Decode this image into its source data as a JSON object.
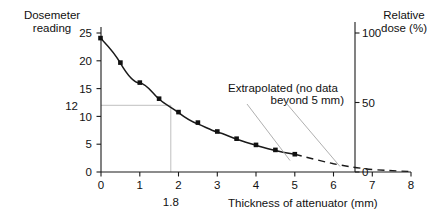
{
  "chart_data": {
    "type": "line",
    "title": "",
    "xlabel": "Thickness of attenuator (mm)",
    "ylabel": "Dosemeter reading",
    "ylabel_right": "Relative dose (%)",
    "xlim": [
      0,
      8
    ],
    "ylim": [
      0,
      25
    ],
    "ylim_right": [
      0,
      100
    ],
    "grid": false,
    "legend": null,
    "xticks": [
      0,
      1,
      2,
      3,
      4,
      5,
      6,
      7,
      8
    ],
    "xticklabels": [
      "0",
      "1",
      "2",
      "3",
      "4",
      "5",
      "6",
      "7",
      "8"
    ],
    "yticks": [
      0,
      5,
      10,
      15,
      20,
      25
    ],
    "yticklabels": [
      "0",
      "5",
      "10",
      "15",
      "20",
      "25"
    ],
    "yticks_right": [
      0,
      50,
      100
    ],
    "yticklabels_right": [
      "0",
      "50",
      "100"
    ],
    "series": [
      {
        "name": "Measured data",
        "style": "solid-with-markers",
        "marker": "square",
        "x": [
          0.0,
          0.5,
          1.0,
          1.5,
          2.0,
          2.5,
          3.0,
          3.5,
          4.0,
          4.5,
          5.0
        ],
        "y": [
          24.0,
          19.6,
          16.0,
          13.1,
          10.7,
          8.8,
          7.2,
          5.9,
          4.8,
          3.9,
          3.2
        ]
      },
      {
        "name": "Extrapolated (no data beyond 5 mm)",
        "style": "dashed",
        "marker": "none",
        "x": [
          5.0,
          5.5,
          6.0,
          6.5,
          7.0,
          7.5,
          8.0
        ],
        "y": [
          3.2,
          2.6,
          2.1,
          1.7,
          1.4,
          1.2,
          0.95
        ]
      }
    ],
    "annotations": [
      {
        "name": "extrapolated-note",
        "line1": "Extrapolated (no data",
        "line2": "beyond 5 mm)",
        "leader_targets": [
          [
            6.0,
            1.95
          ],
          [
            7.35,
            1.25
          ]
        ]
      }
    ],
    "guides": {
      "name": "reading-12-guide",
      "y_value": 12,
      "y_value_label": "12",
      "x_value": 1.8,
      "x_value_label": "1.8"
    }
  }
}
